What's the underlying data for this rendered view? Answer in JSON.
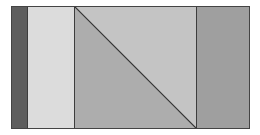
{
  "diagram": {
    "type": "panel-diagram",
    "panels": [
      {
        "name": "dark-strip",
        "color": "#5e5e5e",
        "width": 15
      },
      {
        "name": "light-panel",
        "color": "#dcdcdc",
        "width": 47
      },
      {
        "name": "split-panel",
        "upper_color": "#c4c4c4",
        "lower_color": "#adadad",
        "width": 122,
        "diagonal": "top-left to bottom-right"
      },
      {
        "name": "right-panel",
        "color": "#9f9f9f",
        "width": 55
      }
    ],
    "border_color": "#444444",
    "line_color": "#333333"
  }
}
